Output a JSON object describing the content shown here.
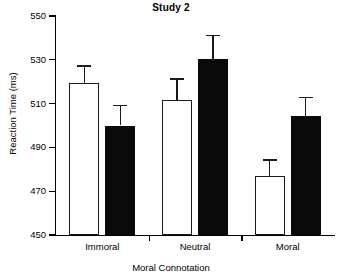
{
  "chart_data": {
    "type": "bar",
    "title": "Study 2",
    "xlabel": "Moral Connotation",
    "ylabel": "Reaction Time (ms)",
    "categories": [
      "Immoral",
      "Neutral",
      "Moral"
    ],
    "ylim": [
      450,
      550
    ],
    "yticks": [
      450,
      470,
      490,
      510,
      530,
      550
    ],
    "ytick_labels": [
      "450",
      "470",
      "490",
      "510",
      "530",
      "550"
    ],
    "grid": false,
    "legend": null,
    "error_bars": "standard error",
    "series": [
      {
        "name": "open-bars",
        "fill": "#ffffff",
        "values": [
          519.5,
          511.5,
          477.0
        ],
        "errors": [
          8.0,
          10.0,
          7.5
        ]
      },
      {
        "name": "filled-bars",
        "fill": "#0a0a0a",
        "values": [
          500.0,
          530.5,
          504.5
        ],
        "errors": [
          9.5,
          11.0,
          8.5
        ]
      }
    ]
  },
  "colors": {
    "axis": "#000000",
    "open_bar": "#ffffff",
    "filled_bar": "#0a0a0a",
    "background": "#ffffff"
  }
}
